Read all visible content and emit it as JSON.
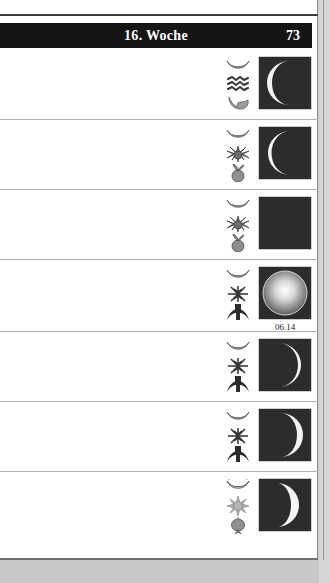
{
  "page": {
    "header": {
      "title": "16. Woche",
      "page_number": "73"
    },
    "background_color": "#c8c8c8",
    "paper_color": "#ffffff",
    "header_bar_color": "#151515",
    "moon_box_color": "#2a2a2a"
  },
  "rows": [
    {
      "index": 1,
      "moon_phase_icon": "crescent-moon-open-up-icon",
      "zodiac_icon": "zodiac-aquarius-icon",
      "plant_part_icon": "leaf-icon",
      "moon_image": "waxing-crescent",
      "moon_time": ""
    },
    {
      "index": 2,
      "moon_phase_icon": "crescent-moon-open-up-icon",
      "zodiac_icon": "zodiac-pisces-star-icon",
      "plant_part_icon": "fruit-icon",
      "moon_image": "waxing-crescent-wide",
      "moon_time": ""
    },
    {
      "index": 3,
      "moon_phase_icon": "crescent-moon-open-up-icon",
      "zodiac_icon": "zodiac-pisces-star-icon",
      "plant_part_icon": "fruit-icon",
      "moon_image": "waxing-crescent-thin",
      "moon_time": ""
    },
    {
      "index": 4,
      "moon_phase_icon": "crescent-moon-open-up-icon",
      "zodiac_icon": "zodiac-aries-star-icon",
      "plant_part_icon": "root-icon",
      "moon_image": "full-moon",
      "moon_time": "06.14"
    },
    {
      "index": 5,
      "moon_phase_icon": "crescent-moon-open-up-icon",
      "zodiac_icon": "zodiac-aries-star-icon",
      "plant_part_icon": "root-icon",
      "moon_image": "waning-crescent-wide",
      "moon_time": ""
    },
    {
      "index": 6,
      "moon_phase_icon": "crescent-moon-open-up-icon",
      "zodiac_icon": "zodiac-aries-star-icon",
      "plant_part_icon": "root-icon",
      "moon_image": "waning-crescent",
      "moon_time": ""
    },
    {
      "index": 7,
      "moon_phase_icon": "crescent-moon-filled-icon",
      "zodiac_icon": "sun-burst-icon",
      "plant_part_icon": "flower-bulb-icon",
      "moon_image": "waning-crescent-bold",
      "moon_time": ""
    }
  ]
}
